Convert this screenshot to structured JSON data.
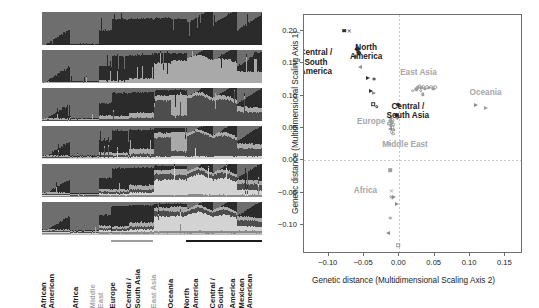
{
  "figure": {
    "title": "",
    "panels": [
      "structure-admixture",
      "mds-scatter"
    ]
  },
  "structure": {
    "k_labels": [
      "K = 2",
      "K = 3",
      "K = 4",
      "K = 5",
      "K = 6",
      "K = 7"
    ],
    "k_values": [
      2,
      3,
      4,
      5,
      6,
      7
    ],
    "populations": [
      {
        "label": "African American",
        "line1": "African",
        "line2": "American",
        "muted": false,
        "x_start": 0.0,
        "x_end": 0.125
      },
      {
        "label": "Africa",
        "line1": "Africa",
        "line2": "",
        "muted": false,
        "x_start": 0.125,
        "x_end": 0.255
      },
      {
        "label": "Middle East",
        "line1": "Middle",
        "line2": "East",
        "muted": true,
        "x_start": 0.255,
        "x_end": 0.315
      },
      {
        "label": "Europe",
        "line1": "Europe",
        "line2": "",
        "muted": false,
        "x_start": 0.315,
        "x_end": 0.395
      },
      {
        "label": "Central / South Asia",
        "line1": "Central /",
        "line2": "South Asia",
        "muted": false,
        "x_start": 0.395,
        "x_end": 0.505
      },
      {
        "label": "East Asia",
        "line1": "East Asia",
        "line2": "",
        "muted": true,
        "x_start": 0.505,
        "x_end": 0.585
      },
      {
        "label": "Oceania",
        "line1": "Oceania",
        "line2": "",
        "muted": false,
        "x_start": 0.585,
        "x_end": 0.655
      },
      {
        "label": "North America",
        "line1": "North",
        "line2": "America",
        "muted": false,
        "x_start": 0.655,
        "x_end": 0.775
      },
      {
        "label": "Central / South America",
        "line1": "Central /",
        "line2": "South",
        "muted": false,
        "x_start": 0.775,
        "x_end": 0.885
      },
      {
        "label": "America Mexican American",
        "line1": "America",
        "line2": "Mexican",
        "line3": "American",
        "muted": false,
        "x_start": 0.885,
        "x_end": 1.0
      }
    ],
    "region_underlines": [
      {
        "x_start": 0.315,
        "x_end": 0.505,
        "weight": "light"
      },
      {
        "x_start": 0.655,
        "x_end": 1.0,
        "weight": "bold"
      }
    ],
    "palette": {
      "c1": "#6e6e6e",
      "c2": "#2b2b2b",
      "c3": "#a9a9a9",
      "c4": "#4d4d4d",
      "c5": "#d3d3d3",
      "c6": "#8a8a8a",
      "c7": "#bdbdbd"
    }
  },
  "chart_data": {
    "type": "scatter",
    "title": "",
    "xlabel": "Genetic distance (Multidimensional Scaling Axis 2)",
    "ylabel": "Genetic distance (Multidimensional Scaling Axis 1)",
    "xlim": [
      -0.135,
      0.175
    ],
    "ylim": [
      -0.145,
      0.225
    ],
    "xticks": [
      -0.1,
      -0.05,
      0.0,
      0.05,
      0.1,
      0.15
    ],
    "xticklabels": [
      "−0.10",
      "−0.05",
      "0.00",
      "0.05",
      "0.10",
      "0.15"
    ],
    "yticks": [
      -0.1,
      -0.05,
      0.0,
      0.05,
      0.1,
      0.15,
      0.2
    ],
    "yticklabels": [
      "−0.10",
      "−0.05",
      "0.00",
      "0.05",
      "0.10",
      "0.15",
      "0.20"
    ],
    "grid": false,
    "zero_reference_lines": {
      "x": 0.0,
      "y": 0.0
    },
    "legend": "inline-annotations",
    "annotations": [
      {
        "text": "Central /\nSouth\nAmerica",
        "x": -0.118,
        "y": 0.152,
        "emphasis": "dark"
      },
      {
        "text": "North\nAmerica",
        "x": -0.047,
        "y": 0.168,
        "emphasis": "dark"
      },
      {
        "text": "East Asia",
        "x": 0.027,
        "y": 0.135,
        "emphasis": "light"
      },
      {
        "text": "Oceania",
        "x": 0.122,
        "y": 0.105,
        "emphasis": "light"
      },
      {
        "text": "Europe",
        "x": -0.04,
        "y": 0.06,
        "emphasis": "light"
      },
      {
        "text": "Central /\nSouth Asia",
        "x": 0.012,
        "y": 0.077,
        "emphasis": "dark"
      },
      {
        "text": "Middle East",
        "x": 0.008,
        "y": 0.023,
        "emphasis": "light"
      },
      {
        "text": "Africa",
        "x": -0.048,
        "y": -0.048,
        "emphasis": "light"
      }
    ],
    "series": [
      {
        "name": "Central / South America",
        "emphasis": "dark",
        "points": [
          {
            "x": -0.078,
            "y": 0.201,
            "marker": "square-filled"
          },
          {
            "x": -0.071,
            "y": 0.2,
            "marker": "x"
          },
          {
            "x": -0.06,
            "y": 0.172,
            "marker": "diamond-filled"
          },
          {
            "x": -0.058,
            "y": 0.167,
            "marker": "diamond-filled"
          },
          {
            "x": -0.062,
            "y": 0.161,
            "marker": "plus"
          },
          {
            "x": -0.056,
            "y": 0.144,
            "marker": "triangle-left-open"
          },
          {
            "x": -0.044,
            "y": 0.128,
            "marker": "triangle-right-filled"
          },
          {
            "x": -0.036,
            "y": 0.126,
            "marker": "asterisk"
          },
          {
            "x": -0.04,
            "y": 0.107,
            "marker": "triangle-right-filled"
          },
          {
            "x": -0.036,
            "y": 0.105,
            "marker": "triangle-right-open"
          },
          {
            "x": -0.037,
            "y": 0.087,
            "marker": "square-open"
          },
          {
            "x": -0.032,
            "y": 0.083,
            "marker": "circle-open"
          }
        ]
      },
      {
        "name": "North America",
        "emphasis": "dark",
        "points": [
          {
            "x": -0.06,
            "y": 0.172,
            "marker": "diamond-filled"
          },
          {
            "x": -0.057,
            "y": 0.166,
            "marker": "diamond-filled"
          },
          {
            "x": -0.062,
            "y": 0.16,
            "marker": "plus"
          }
        ]
      },
      {
        "name": "Europe",
        "emphasis": "light",
        "points": [
          {
            "x": -0.014,
            "y": 0.068,
            "marker": "circle-open"
          },
          {
            "x": -0.012,
            "y": 0.065,
            "marker": "circle-filled"
          },
          {
            "x": -0.01,
            "y": 0.063,
            "marker": "circle-open"
          },
          {
            "x": -0.013,
            "y": 0.061,
            "marker": "circle-filled"
          },
          {
            "x": -0.009,
            "y": 0.06,
            "marker": "x"
          },
          {
            "x": -0.011,
            "y": 0.058,
            "marker": "circle-filled"
          },
          {
            "x": -0.014,
            "y": 0.057,
            "marker": "square-open"
          },
          {
            "x": -0.009,
            "y": 0.055,
            "marker": "circle-open"
          },
          {
            "x": -0.012,
            "y": 0.054,
            "marker": "circle-filled"
          },
          {
            "x": -0.01,
            "y": 0.051,
            "marker": "circle-open"
          },
          {
            "x": -0.013,
            "y": 0.049,
            "marker": "triangle-left-open"
          },
          {
            "x": -0.008,
            "y": 0.047,
            "marker": "circle-filled"
          },
          {
            "x": -0.011,
            "y": 0.044,
            "marker": "circle-open"
          },
          {
            "x": -0.009,
            "y": 0.041,
            "marker": "circle-open"
          }
        ]
      },
      {
        "name": "Central / South Asia",
        "emphasis": "dark",
        "points": [
          {
            "x": -0.002,
            "y": 0.085,
            "marker": "asterisk-filled"
          },
          {
            "x": -0.004,
            "y": 0.07,
            "marker": "diamond-filled"
          },
          {
            "x": -0.003,
            "y": 0.066,
            "marker": "plus"
          }
        ]
      },
      {
        "name": "East Asia",
        "emphasis": "light",
        "points": [
          {
            "x": 0.019,
            "y": 0.108,
            "marker": "circle-open"
          },
          {
            "x": 0.026,
            "y": 0.113,
            "marker": "circle-filled"
          },
          {
            "x": 0.029,
            "y": 0.115,
            "marker": "circle-open"
          },
          {
            "x": 0.031,
            "y": 0.112,
            "marker": "circle-filled"
          },
          {
            "x": 0.034,
            "y": 0.114,
            "marker": "circle-open"
          },
          {
            "x": 0.036,
            "y": 0.111,
            "marker": "circle-filled"
          },
          {
            "x": 0.039,
            "y": 0.113,
            "marker": "circle-open"
          },
          {
            "x": 0.042,
            "y": 0.112,
            "marker": "circle-filled"
          },
          {
            "x": 0.045,
            "y": 0.114,
            "marker": "circle-open"
          },
          {
            "x": 0.048,
            "y": 0.111,
            "marker": "circle-filled"
          },
          {
            "x": 0.051,
            "y": 0.113,
            "marker": "circle-open"
          },
          {
            "x": 0.033,
            "y": 0.102,
            "marker": "circle-filled"
          },
          {
            "x": 0.024,
            "y": 0.11,
            "marker": "circle-filled"
          },
          {
            "x": 0.03,
            "y": 0.108,
            "marker": "circle-open"
          }
        ]
      },
      {
        "name": "Oceania",
        "emphasis": "light",
        "points": [
          {
            "x": 0.108,
            "y": 0.085,
            "marker": "triangle-right-open"
          },
          {
            "x": 0.123,
            "y": 0.081,
            "marker": "triangle-right-filled"
          }
        ]
      },
      {
        "name": "Middle East",
        "emphasis": "light",
        "points": [
          {
            "x": -0.014,
            "y": 0.026,
            "marker": "circle-open"
          }
        ]
      },
      {
        "name": "Africa",
        "emphasis": "light",
        "points": [
          {
            "x": -0.013,
            "y": -0.015,
            "marker": "square-filled"
          },
          {
            "x": -0.011,
            "y": -0.048,
            "marker": "x"
          },
          {
            "x": -0.012,
            "y": -0.056,
            "marker": "circle-open"
          },
          {
            "x": -0.01,
            "y": -0.059,
            "marker": "plus"
          },
          {
            "x": -0.008,
            "y": -0.057,
            "marker": "triangle-right-open"
          },
          {
            "x": -0.004,
            "y": -0.068,
            "marker": "triangle-right-open"
          },
          {
            "x": -0.013,
            "y": -0.089,
            "marker": "asterisk"
          },
          {
            "x": -0.016,
            "y": -0.113,
            "marker": "triangle-left-open"
          },
          {
            "x": -0.002,
            "y": -0.131,
            "marker": "square-open"
          }
        ]
      }
    ]
  }
}
